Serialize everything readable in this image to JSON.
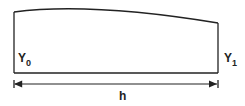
{
  "diagram": {
    "type": "trapezoidal-area-segment",
    "labels": {
      "left_ordinate": "Y",
      "left_subscript": "0",
      "right_ordinate": "Y",
      "right_subscript": "1",
      "width": "h"
    },
    "colors": {
      "stroke": "#222222",
      "background": "#ffffff"
    }
  }
}
